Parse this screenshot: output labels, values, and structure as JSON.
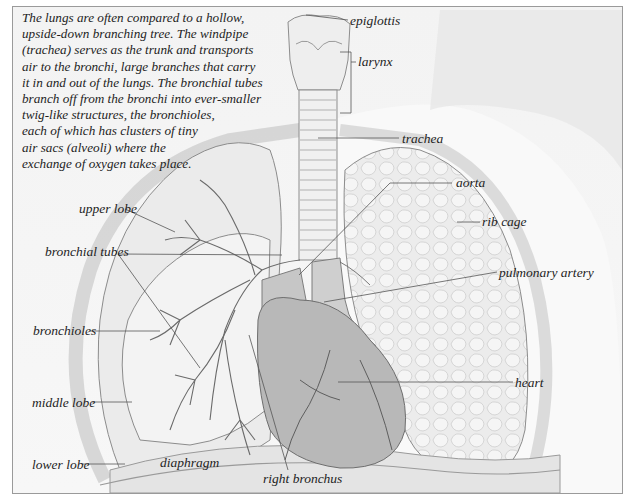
{
  "intro": {
    "lines": [
      "The lungs are often compared to a hollow,",
      "upside-down branching tree. The windpipe",
      "(trachea) serves as the trunk and transports",
      "air to the bronchi, large branches that carry",
      "it in and out of the lungs. The bronchial tubes",
      "branch off from the bronchi into ever-smaller",
      "twig-like structures, the bronchioles,",
      "each of which has clusters of tiny",
      "air sacs (alveoli) where the",
      "exchange of oxygen takes place."
    ]
  },
  "labels": {
    "epiglottis": "epiglottis",
    "larynx": "larynx",
    "trachea": "trachea",
    "aorta": "aorta",
    "rib_cage": "rib cage",
    "pulmonary_artery": "pulmonary artery",
    "upper_lobe": "upper lobe",
    "bronchial_tubes": "bronchial tubes",
    "bronchioles": "bronchioles",
    "heart": "heart",
    "middle_lobe": "middle lobe",
    "lower_lobe": "lower lobe",
    "diaphragm": "diaphragm",
    "right_bronchus": "right bronchus"
  },
  "colors": {
    "background": "#f4f4f4",
    "frame": "#9a9a9a",
    "lung_fill": "#e9e9e9",
    "lung_stroke": "#8a8a8a",
    "heart_fill": "#b9b9b9",
    "vessel_fill": "#c4c4c4",
    "leader_line": "#555555",
    "text": "#1e1e1e"
  }
}
